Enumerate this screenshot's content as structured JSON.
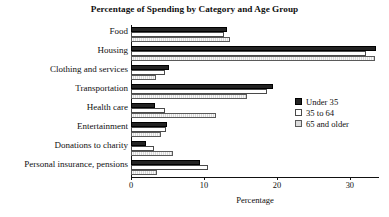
{
  "chart_data": {
    "type": "bar",
    "orientation": "horizontal",
    "title": "Percentage of Spending by Category and Age Group",
    "xlabel": "Percentage",
    "ylabel": "",
    "xlim": [
      0,
      34
    ],
    "xticks": [
      0,
      10,
      20,
      30
    ],
    "xtick_labels": [
      "0",
      "10",
      "20",
      "30"
    ],
    "grid": false,
    "legend_position": "right",
    "categories": [
      "Food",
      "Housing",
      "Clothing and services",
      "Transportation",
      "Health care",
      "Entertainment",
      "Donations to charity",
      "Personal insurance, pensions"
    ],
    "series": [
      {
        "name": "Under 35",
        "color": "#232323",
        "values": [
          13.2,
          33.6,
          5.2,
          19.4,
          3.3,
          5.0,
          2.1,
          9.5
        ]
      },
      {
        "name": "35 to 64",
        "color": "#ffffff",
        "values": [
          12.7,
          32.2,
          4.7,
          18.6,
          4.6,
          4.8,
          3.2,
          10.6
        ]
      },
      {
        "name": "65 and older",
        "color": "#dcdcdc",
        "values": [
          13.6,
          33.5,
          3.4,
          15.9,
          11.6,
          4.1,
          5.7,
          3.6
        ]
      }
    ]
  }
}
